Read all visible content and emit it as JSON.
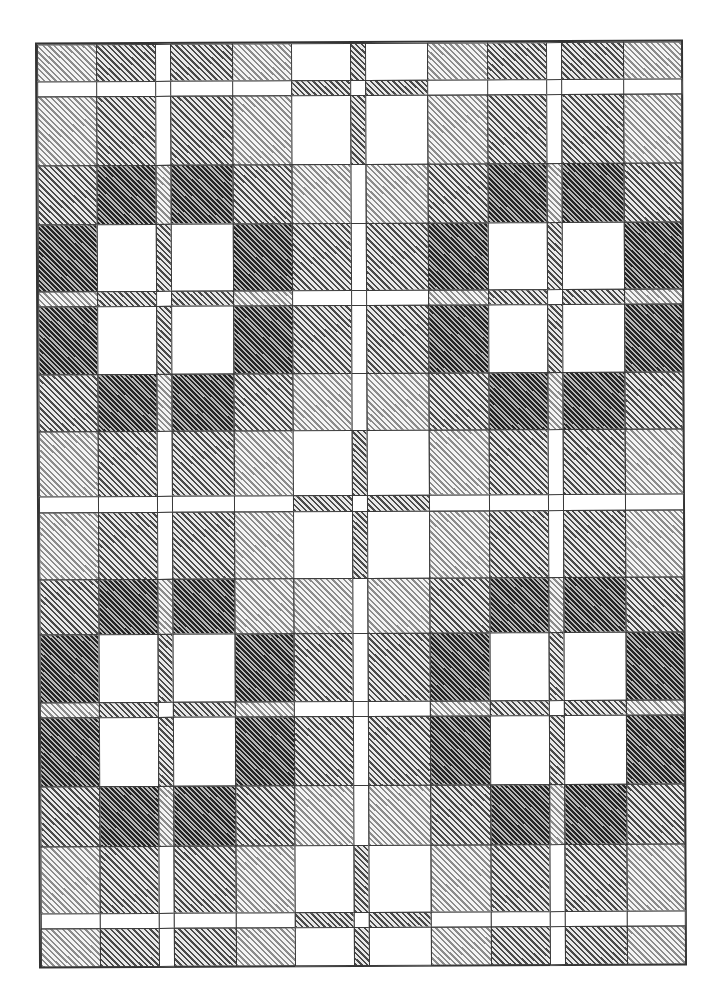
{
  "pattern": {
    "title": "",
    "type": "plaid-hatched-grid",
    "hatch_angle_deg": -45,
    "shade_levels": [
      {
        "level": 0,
        "name": "white",
        "color": "#ffffff",
        "line": "#ffffff",
        "spacing": 4
      },
      {
        "level": 1,
        "name": "light",
        "color": "#f4f4f4",
        "line": "#8c8c8c",
        "spacing": 4
      },
      {
        "level": 2,
        "name": "medium",
        "color": "#e8e8e8",
        "line": "#4a4a4a",
        "spacing": 4
      },
      {
        "level": 3,
        "name": "medium-dark",
        "color": "#b8b8b8",
        "line": "#262626",
        "spacing": 3.4
      },
      {
        "level": 4,
        "name": "dark",
        "color": "#8a8a8a",
        "line": "#111111",
        "spacing": 3
      }
    ],
    "columns_px": [
      0,
      59,
      118,
      133,
      195,
      254,
      313,
      328,
      390,
      450,
      509,
      524,
      586,
      644
    ],
    "rows_px": [
      0,
      37,
      52,
      121,
      180,
      247,
      262,
      330,
      387,
      452,
      468,
      535,
      590,
      658,
      673,
      742,
      802,
      869,
      884,
      922
    ],
    "grid": [
      [
        1,
        2,
        0,
        2,
        1,
        0,
        2,
        0,
        1,
        2,
        0,
        2,
        1
      ],
      [
        0,
        0,
        0,
        0,
        0,
        2,
        0,
        2,
        0,
        0,
        0,
        0,
        0
      ],
      [
        1,
        2,
        0,
        2,
        1,
        0,
        2,
        0,
        1,
        2,
        0,
        2,
        1
      ],
      [
        2,
        3,
        1,
        3,
        2,
        1,
        0,
        1,
        2,
        3,
        1,
        3,
        2
      ],
      [
        3,
        0,
        2,
        0,
        3,
        2,
        0,
        2,
        3,
        0,
        2,
        0,
        3
      ],
      [
        1,
        2,
        0,
        2,
        1,
        0,
        0,
        0,
        1,
        2,
        0,
        2,
        1
      ],
      [
        3,
        0,
        2,
        0,
        3,
        2,
        0,
        2,
        3,
        0,
        2,
        0,
        3
      ],
      [
        2,
        3,
        1,
        3,
        2,
        1,
        0,
        1,
        2,
        3,
        1,
        3,
        2
      ],
      [
        1,
        2,
        0,
        2,
        1,
        0,
        2,
        0,
        1,
        2,
        0,
        2,
        1
      ],
      [
        0,
        0,
        0,
        0,
        0,
        2,
        0,
        2,
        0,
        0,
        0,
        0,
        0
      ],
      [
        1,
        2,
        0,
        2,
        1,
        0,
        2,
        0,
        1,
        2,
        0,
        2,
        1
      ],
      [
        2,
        3,
        1,
        3,
        1,
        1,
        0,
        1,
        2,
        3,
        1,
        3,
        2
      ],
      [
        3,
        0,
        2,
        0,
        3,
        2,
        0,
        2,
        3,
        0,
        2,
        0,
        3
      ],
      [
        1,
        2,
        0,
        2,
        1,
        0,
        0,
        0,
        1,
        2,
        0,
        2,
        1
      ],
      [
        3,
        0,
        2,
        0,
        3,
        2,
        0,
        2,
        3,
        0,
        2,
        0,
        3
      ],
      [
        2,
        3,
        1,
        3,
        2,
        1,
        0,
        1,
        2,
        3,
        1,
        3,
        2
      ],
      [
        1,
        2,
        0,
        2,
        1,
        0,
        2,
        0,
        1,
        2,
        0,
        2,
        1
      ],
      [
        0,
        0,
        0,
        0,
        0,
        2,
        0,
        2,
        0,
        0,
        0,
        0,
        0
      ],
      [
        1,
        2,
        0,
        2,
        1,
        0,
        2,
        0,
        1,
        2,
        0,
        2,
        1
      ]
    ]
  }
}
